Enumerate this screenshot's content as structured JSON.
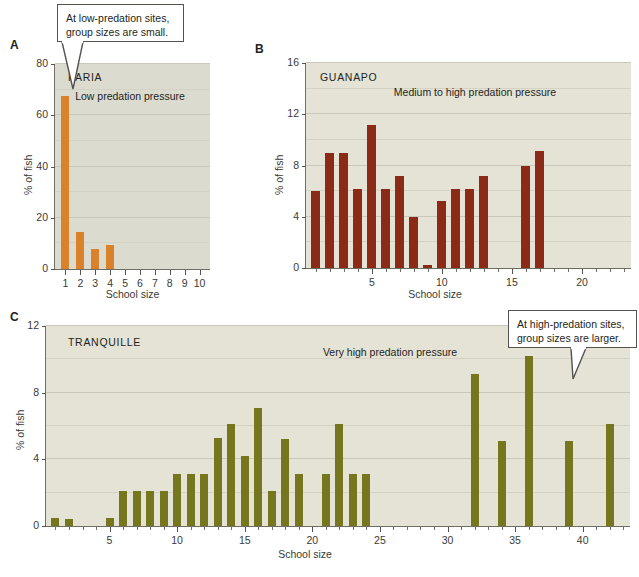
{
  "figure": {
    "background": "#ffffff",
    "plot_background_a": "#dcdbd0",
    "plot_background_bc": "#e4e3d6"
  },
  "callouts": [
    {
      "id": "low-predation",
      "text": "At low-predation sites,\ngroup sizes are small."
    },
    {
      "id": "high-predation",
      "text": "At high-predation sites,\ngroup sizes are larger."
    }
  ],
  "panels": [
    {
      "letter": "A",
      "site": "PARIA",
      "note": "Low predation\npressure",
      "color": "#d9822b"
    },
    {
      "letter": "B",
      "site": "GUANAPO",
      "note": "Medium to high predation\npressure",
      "color": "#8b2a16"
    },
    {
      "letter": "C",
      "site": "TRANQUILLE",
      "note": "Very high predation\npressure",
      "color": "#76761f"
    }
  ],
  "chart_data": [
    {
      "type": "bar",
      "panel": "A",
      "title": "PARIA",
      "annotation": "Low predation pressure",
      "xlabel": "School size",
      "ylabel": "% of fish",
      "xlim": [
        0.3,
        10.7
      ],
      "ylim": [
        0,
        80
      ],
      "ytick_labels": [
        "0",
        "20",
        "40",
        "60",
        "80"
      ],
      "yticks": [
        0,
        20,
        40,
        60,
        80
      ],
      "ygrid": [
        10,
        20,
        30,
        40,
        50,
        60,
        70,
        80
      ],
      "xtick_labels": [
        "1",
        "2",
        "3",
        "4",
        "5",
        "6",
        "7",
        "8",
        "9",
        "10"
      ],
      "xticks": [
        1,
        2,
        3,
        4,
        5,
        6,
        7,
        8,
        9,
        10
      ],
      "color": "#d9822b",
      "grid": true,
      "legend": "none",
      "x": [
        1,
        2,
        3,
        4
      ],
      "values": [
        67.5,
        14.5,
        8.0,
        9.5
      ]
    },
    {
      "type": "bar",
      "panel": "B",
      "title": "GUANAPO",
      "annotation": "Medium to high predation pressure",
      "xlabel": "School size",
      "ylabel": "% of fish",
      "xlim": [
        0.3,
        23.5
      ],
      "ylim": [
        0,
        16
      ],
      "ytick_labels": [
        "0",
        "4",
        "8",
        "12",
        "16"
      ],
      "yticks": [
        0,
        4,
        8,
        12,
        16
      ],
      "ygrid": [
        2,
        4,
        6,
        8,
        10,
        12,
        14,
        16
      ],
      "xtick_labels": [
        "5",
        "10",
        "15",
        "20"
      ],
      "xticks": [
        5,
        10,
        15,
        20
      ],
      "color": "#8b2a16",
      "grid": true,
      "legend": "none",
      "x": [
        1,
        2,
        3,
        4,
        5,
        6,
        7,
        8,
        9,
        10,
        11,
        12,
        13,
        16,
        17
      ],
      "values": [
        6.0,
        9.0,
        9.0,
        6.2,
        11.2,
        6.2,
        7.2,
        4.0,
        0.2,
        5.2,
        6.2,
        6.2,
        7.2,
        8.0,
        9.1
      ]
    },
    {
      "type": "bar",
      "panel": "C",
      "title": "TRANQUILLE",
      "annotation": "Very high predation pressure",
      "xlabel": "School size",
      "ylabel": "% of fish",
      "xlim": [
        0.3,
        43.5
      ],
      "ylim": [
        0,
        12
      ],
      "ytick_labels": [
        "0",
        "4",
        "8",
        "12"
      ],
      "yticks": [
        0,
        4,
        8,
        12
      ],
      "ygrid": [
        2,
        4,
        6,
        8,
        10,
        12
      ],
      "xtick_labels": [
        "5",
        "10",
        "15",
        "20",
        "25",
        "30",
        "35",
        "40"
      ],
      "xticks": [
        5,
        10,
        15,
        20,
        25,
        30,
        35,
        40
      ],
      "color": "#76761f",
      "grid": true,
      "legend": "none",
      "x": [
        1,
        2,
        5,
        6,
        7,
        8,
        9,
        10,
        11,
        12,
        13,
        14,
        15,
        16,
        17,
        18,
        19,
        21,
        22,
        23,
        24,
        32,
        34,
        36,
        39,
        42
      ],
      "values": [
        0.5,
        0.4,
        0.5,
        2.1,
        2.1,
        2.1,
        2.1,
        3.1,
        3.1,
        3.1,
        5.3,
        6.1,
        4.2,
        7.1,
        2.1,
        5.2,
        3.1,
        3.1,
        6.1,
        3.1,
        3.1,
        9.1,
        5.1,
        10.2,
        5.1,
        6.1
      ]
    }
  ]
}
